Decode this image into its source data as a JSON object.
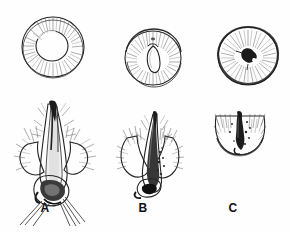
{
  "figure": {
    "style": "pen-and-ink line drawing",
    "background_color": "#fefefe",
    "ink_color": "#1b1b1b",
    "rows": [
      {
        "row_name": "surface-view-row",
        "description": "top-down surface views of follicular openings"
      },
      {
        "row_name": "section-view-row",
        "description": "longitudinal sections of hair follicles"
      }
    ],
    "panels": [
      {
        "id": "a",
        "label": "A",
        "top_view": {
          "name": "surface-view-a",
          "description": "round follicular opening with large dark central hair shaft",
          "center_x": 52,
          "center_y": 47,
          "outer_radius": 31,
          "inner_radius": 15
        },
        "section_view": {
          "name": "section-view-a",
          "description": "anagen follicle with deep bulb and root sheath strands"
        }
      },
      {
        "id": "b",
        "label": "B",
        "top_view": {
          "name": "surface-view-b",
          "description": "round opening with smaller teardrop-shaped dark shaft",
          "center_x": 152,
          "center_y": 57,
          "outer_radius": 28,
          "inner_radius": 9
        },
        "section_view": {
          "name": "section-view-b",
          "description": "catagen follicle, shortened club-shaped hair"
        }
      },
      {
        "id": "c",
        "label": "C",
        "top_view": {
          "name": "surface-view-c",
          "description": "round opening with small irregular dark remnant at center",
          "center_x": 247,
          "center_y": 55,
          "outer_radius": 30,
          "inner_radius": 6
        },
        "section_view": {
          "name": "section-view-c",
          "description": "telogen follicle, shallow residual sac only"
        }
      }
    ]
  }
}
